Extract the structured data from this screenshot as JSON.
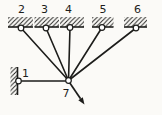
{
  "figure": {
    "paper_color": "#fbfaf7",
    "ink_color": "#1d1d1b",
    "pin_fill": "#ffffff",
    "labels": [
      {
        "name": "node-label-2",
        "text": "2",
        "x": 21.5,
        "y": 13
      },
      {
        "name": "node-label-3",
        "text": "3",
        "x": 44.5,
        "y": 13
      },
      {
        "name": "node-label-4",
        "text": "4",
        "x": 68.5,
        "y": 13
      },
      {
        "name": "node-label-5",
        "text": "5",
        "x": 103,
        "y": 13
      },
      {
        "name": "node-label-6",
        "text": "6",
        "x": 137.5,
        "y": 13
      },
      {
        "name": "node-label-1",
        "text": "1",
        "x": 25.5,
        "y": 76.5
      },
      {
        "name": "node-label-7",
        "text": "7",
        "x": 66,
        "y": 97
      }
    ],
    "anchors": [
      {
        "name": "ceiling-anchor-2",
        "edge": "bottom",
        "x": 8,
        "y": 17,
        "w": 25,
        "h": 10
      },
      {
        "name": "ceiling-anchor-3",
        "edge": "bottom",
        "x": 34.5,
        "y": 17,
        "w": 24.5,
        "h": 10
      },
      {
        "name": "ceiling-anchor-4",
        "edge": "bottom",
        "x": 60,
        "y": 17,
        "w": 24,
        "h": 10
      },
      {
        "name": "ceiling-anchor-5",
        "edge": "bottom",
        "x": 92,
        "y": 17,
        "w": 21.5,
        "h": 10
      },
      {
        "name": "ceiling-anchor-6",
        "edge": "bottom",
        "x": 124,
        "y": 17,
        "w": 23,
        "h": 10
      },
      {
        "name": "wall-anchor-1",
        "edge": "right",
        "x": 10.5,
        "y": 67,
        "w": 7,
        "h": 28
      }
    ],
    "members": [
      {
        "name": "rod-2-7",
        "x1": 21,
        "y1": 28,
        "x2": 68.5,
        "y2": 80.5
      },
      {
        "name": "rod-3-7",
        "x1": 46,
        "y1": 28,
        "x2": 68.5,
        "y2": 80.5
      },
      {
        "name": "rod-4-7",
        "x1": 70,
        "y1": 27.5,
        "x2": 68.5,
        "y2": 80.5
      },
      {
        "name": "rod-5-7",
        "x1": 102,
        "y1": 27.5,
        "x2": 68.5,
        "y2": 80.5
      },
      {
        "name": "rod-6-7",
        "x1": 136,
        "y1": 28,
        "x2": 68.5,
        "y2": 80.5
      },
      {
        "name": "rod-1-7",
        "x1": 18.5,
        "y1": 81,
        "x2": 68.5,
        "y2": 81
      }
    ],
    "pins": [
      {
        "name": "pin-2",
        "cx": 21,
        "cy": 28
      },
      {
        "name": "pin-3",
        "cx": 46,
        "cy": 28
      },
      {
        "name": "pin-4",
        "cx": 70,
        "cy": 27.5
      },
      {
        "name": "pin-5",
        "cx": 102,
        "cy": 27.5
      },
      {
        "name": "pin-6",
        "cx": 136,
        "cy": 28
      },
      {
        "name": "pin-1",
        "cx": 18.5,
        "cy": 81
      },
      {
        "name": "pin-7",
        "cx": 68.5,
        "cy": 80.5
      }
    ],
    "pin_radius": 2.8,
    "force": {
      "name": "force-arrow",
      "x1": 68.5,
      "y1": 81,
      "x2": 84.5,
      "y2": 104.5
    }
  }
}
